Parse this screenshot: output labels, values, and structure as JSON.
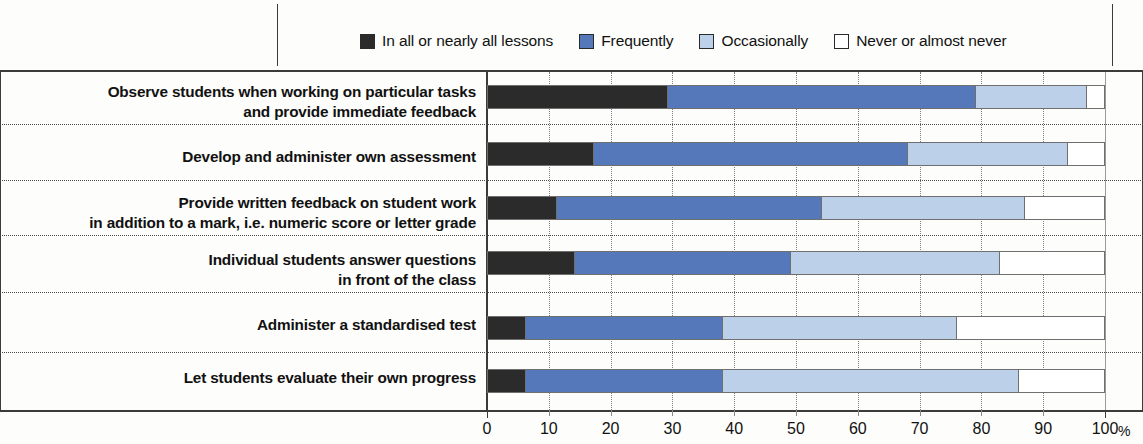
{
  "legend": {
    "items": [
      {
        "label": "In all or nearly all lessons",
        "color": "#2b2b2b",
        "icon": "legend-swatch-icon"
      },
      {
        "label": "Frequently",
        "color": "#5578bb",
        "icon": "legend-swatch-icon"
      },
      {
        "label": "Occasionally",
        "color": "#bcd0ea",
        "icon": "legend-swatch-icon"
      },
      {
        "label": "Never or almost never",
        "color": "#ffffff",
        "icon": "legend-swatch-icon"
      }
    ]
  },
  "axis": {
    "unit": "%",
    "ticks": [
      "0",
      "10",
      "20",
      "30",
      "40",
      "50",
      "60",
      "70",
      "80",
      "90",
      "100"
    ]
  },
  "chart_data": {
    "type": "bar",
    "orientation": "horizontal",
    "stacked": true,
    "normalized_percent": true,
    "title": "",
    "xlabel": "%",
    "ylabel": "",
    "xlim": [
      0,
      100
    ],
    "grid": true,
    "legend_position": "top",
    "categories": [
      "Observe students when working on particular tasks and provide immediate feedback",
      "Develop and administer own assessment",
      "Provide written feedback on student work in addition to a mark, i.e. numeric score or letter grade",
      "Individual students answer questions in front of the class",
      "Administer a standardised test",
      "Let students evaluate their own progress"
    ],
    "category_lines": [
      [
        "Observe students when working on particular tasks",
        "and provide immediate feedback"
      ],
      [
        "Develop and administer own assessment"
      ],
      [
        "Provide written feedback on student work",
        "in addition to a mark, i.e. numeric score or letter grade"
      ],
      [
        "Individual students answer questions",
        "in front of the class"
      ],
      [
        "Administer a standardised test"
      ],
      [
        "Let students evaluate their own progress"
      ]
    ],
    "series": [
      {
        "name": "In all or nearly all lessons",
        "color": "#2b2b2b",
        "values": [
          29,
          17,
          11,
          14,
          6,
          6
        ]
      },
      {
        "name": "Frequently",
        "color": "#5578bb",
        "values": [
          50,
          51,
          43,
          35,
          32,
          32
        ]
      },
      {
        "name": "Occasionally",
        "color": "#bcd0ea",
        "values": [
          18,
          26,
          33,
          34,
          38,
          48
        ]
      },
      {
        "name": "Never or almost never",
        "color": "#ffffff",
        "values": [
          3,
          6,
          13,
          17,
          24,
          14
        ]
      }
    ],
    "cumulative_boundaries": [
      [
        29,
        79,
        97,
        100
      ],
      [
        17,
        68,
        94,
        100
      ],
      [
        11,
        54,
        87,
        100
      ],
      [
        14,
        49,
        83,
        100
      ],
      [
        6,
        38,
        76,
        100
      ],
      [
        6,
        38,
        86,
        100
      ]
    ]
  }
}
